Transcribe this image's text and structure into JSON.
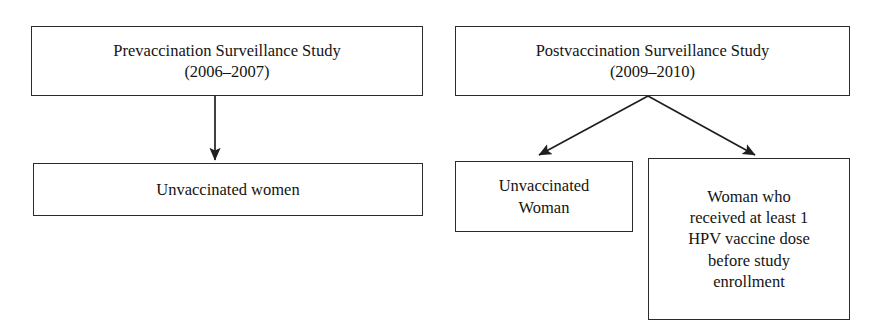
{
  "diagram": {
    "line_color": "#2b2b2b",
    "background_color": "#ffffff",
    "text_color": "#141414",
    "nodes": {
      "prevaccination_study": {
        "label": "Prevaccination Surveillance Study\n(2006–2007)",
        "line1": "Prevaccination Surveillance Study",
        "line2": "(2006–2007)"
      },
      "unvaccinated_women": {
        "label": "Unvaccinated women"
      },
      "postvaccination_study": {
        "label": "Postvaccination Surveillance Study\n(2009–2010)",
        "line1": "Postvaccination Surveillance Study",
        "line2": "(2009–2010)"
      },
      "unvaccinated_woman": {
        "label": "Unvaccinated\nWoman",
        "line1": "Unvaccinated",
        "line2": "Woman"
      },
      "hpv_vaccinated_woman": {
        "label": "Woman who\nreceived at least 1\nHPV vaccine dose\nbefore study\nenrollment",
        "line1": "Woman who",
        "line2": "received at least 1",
        "line3": "HPV vaccine dose",
        "line4": "before study",
        "line5": "enrollment"
      }
    },
    "edges": [
      {
        "name": "prevaccination-to-unvaccinated-women",
        "from": "prevaccination_study",
        "to": "unvaccinated_women",
        "style": "vertical-arrow"
      },
      {
        "name": "postvaccination-to-unvaccinated-woman",
        "from": "postvaccination_study",
        "to": "unvaccinated_woman",
        "style": "diagonal-arrow-left"
      },
      {
        "name": "postvaccination-to-hpv-vaccinated-woman",
        "from": "postvaccination_study",
        "to": "hpv_vaccinated_woman",
        "style": "diagonal-arrow-right"
      }
    ]
  }
}
